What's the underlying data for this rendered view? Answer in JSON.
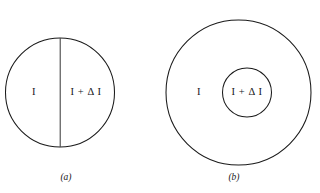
{
  "figure": {
    "background_color": "#ffffff",
    "stroke_color": "#1a1a1a",
    "text_color": "#17171a",
    "panels": [
      {
        "id": "a",
        "caption": "(a)",
        "description": "circle-divided-by-vertical-diameter",
        "labels": {
          "left_region": "I",
          "right_region": "I + Δ I"
        }
      },
      {
        "id": "b",
        "caption": "(b)",
        "description": "concentric-circles",
        "labels": {
          "outer_region": "I",
          "inner_region": "I + Δ I"
        }
      }
    ]
  }
}
